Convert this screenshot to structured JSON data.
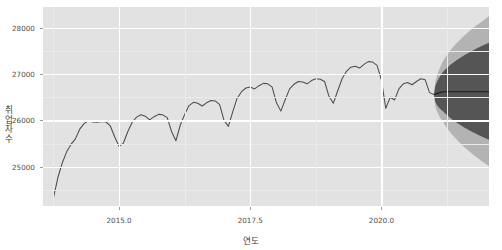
{
  "chart_data": {
    "type": "line",
    "title": "",
    "xlabel": "연도",
    "ylabel": "취업자 수",
    "xlim": [
      2013.55,
      2022.05
    ],
    "ylim": [
      24150,
      28450
    ],
    "xticks": [
      2015.0,
      2017.5,
      2020.0
    ],
    "xtick_labels": [
      "2015.0",
      "2017.5",
      "2020.0"
    ],
    "yticks": [
      25000,
      26000,
      27000,
      28000
    ],
    "ytick_labels": [
      "25000",
      "26000",
      "27000",
      "28000"
    ],
    "grid": true,
    "legend": "none",
    "series": [
      {
        "name": "취업자 수",
        "type": "line",
        "color": "#4d4d4d",
        "x": [
          2013.75,
          2013.833,
          2013.917,
          2014.0,
          2014.083,
          2014.167,
          2014.25,
          2014.333,
          2014.417,
          2014.5,
          2014.583,
          2014.667,
          2014.75,
          2014.833,
          2014.917,
          2015.0,
          2015.083,
          2015.167,
          2015.25,
          2015.333,
          2015.417,
          2015.5,
          2015.583,
          2015.667,
          2015.75,
          2015.833,
          2015.917,
          2016.0,
          2016.083,
          2016.167,
          2016.25,
          2016.333,
          2016.417,
          2016.5,
          2016.583,
          2016.667,
          2016.75,
          2016.833,
          2016.917,
          2017.0,
          2017.083,
          2017.167,
          2017.25,
          2017.333,
          2017.417,
          2017.5,
          2017.583,
          2017.667,
          2017.75,
          2017.833,
          2017.917,
          2018.0,
          2018.083,
          2018.167,
          2018.25,
          2018.333,
          2018.417,
          2018.5,
          2018.583,
          2018.667,
          2018.75,
          2018.833,
          2018.917,
          2019.0,
          2019.083,
          2019.167,
          2019.25,
          2019.333,
          2019.417,
          2019.5,
          2019.583,
          2019.667,
          2019.75,
          2019.833,
          2019.917,
          2020.0,
          2020.083,
          2020.167,
          2020.25,
          2020.333,
          2020.417,
          2020.5,
          2020.583,
          2020.667,
          2020.75,
          2020.833,
          2020.917,
          2021.0
        ],
        "y": [
          24330,
          24760,
          25080,
          25320,
          25480,
          25600,
          25810,
          25930,
          25990,
          25965,
          25960,
          25975,
          25965,
          25880,
          25640,
          25440,
          25510,
          25760,
          25960,
          26070,
          26120,
          26090,
          26010,
          26080,
          26130,
          26120,
          26060,
          25760,
          25560,
          25900,
          26130,
          26320,
          26390,
          26370,
          26310,
          26380,
          26430,
          26420,
          26340,
          26000,
          25870,
          26190,
          26480,
          26620,
          26700,
          26720,
          26680,
          26750,
          26800,
          26790,
          26720,
          26380,
          26200,
          26450,
          26680,
          26780,
          26840,
          26830,
          26790,
          26860,
          26900,
          26890,
          26840,
          26520,
          26370,
          26640,
          26900,
          27060,
          27150,
          27170,
          27130,
          27210,
          27270,
          27260,
          27190,
          26870,
          26260,
          26500,
          26440,
          26680,
          26790,
          26820,
          26770,
          26840,
          26900,
          26880,
          26600,
          26560
        ]
      }
    ],
    "forecast": {
      "name": "예측",
      "start_x": 2021.0,
      "end_x": 2022.05,
      "point_forecast_color": "#1a1a1a",
      "mean_y": 26620,
      "intervals": [
        {
          "level": 80,
          "color": "#555555",
          "lower_end": 25580,
          "upper_end": 27680
        },
        {
          "level": 95,
          "color": "#b3b3b3",
          "lower_end": 25010,
          "upper_end": 28250
        }
      ]
    },
    "panel_background": "#e2e2e2",
    "grid_color": "#ffffff",
    "minor_grid_color": "#ebebeb"
  }
}
